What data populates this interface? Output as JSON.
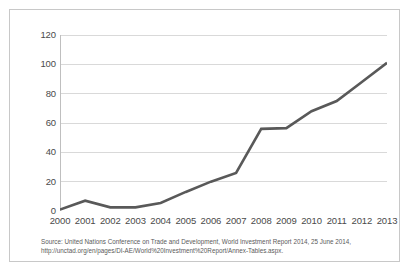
{
  "chart_data": {
    "type": "line",
    "title": "",
    "subtitle": "",
    "xlabel": "",
    "ylabel": "",
    "x": [
      "2000",
      "2001",
      "2002",
      "2003",
      "2004",
      "2005",
      "2006",
      "2007",
      "2008",
      "2009",
      "2010",
      "2011",
      "2012",
      "2013"
    ],
    "categories": [
      "2000",
      "2001",
      "2002",
      "2003",
      "2004",
      "2005",
      "2006",
      "2007",
      "2008",
      "2009",
      "2010",
      "2011",
      "2012",
      "2013"
    ],
    "values": [
      1,
      7,
      2.5,
      2.5,
      5.5,
      13,
      20,
      26,
      56,
      56.5,
      68,
      75,
      88,
      101
    ],
    "series": [
      {
        "name": "",
        "values": [
          1,
          7,
          2.5,
          2.5,
          5.5,
          13,
          20,
          26,
          56,
          56.5,
          68,
          75,
          88,
          101
        ]
      }
    ],
    "ylim": [
      0,
      120
    ],
    "yticks": [
      0,
      20,
      40,
      60,
      80,
      100,
      120
    ],
    "ytick_labels": [
      "0",
      "20",
      "40",
      "60",
      "80",
      "100",
      "120"
    ],
    "xtick_labels": [
      "2000",
      "2001",
      "2002",
      "2003",
      "2004",
      "2005",
      "2006",
      "2007",
      "2008",
      "2009",
      "2010",
      "2011",
      "2012",
      "2013"
    ],
    "grid": "horizontal",
    "legend": "none",
    "line_color": "#595959",
    "line_width": 2.6,
    "grid_color": "#d9d9d9",
    "axis_color": "#bfbfbf",
    "background": "#ffffff",
    "border_color": "#c8c8c8",
    "tick_text_color": "#4a4a4a"
  },
  "source": {
    "text": "Source: United Nations Conference on Trade and Development, World Investment Report 2014, 25 June 2014, http://unctad.org/en/pages/DI-AE/World%20Investment%20Report/Annex-Tables.aspx."
  }
}
